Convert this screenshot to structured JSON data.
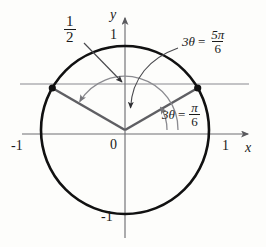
{
  "figure": {
    "type": "unit-circle-diagram",
    "axes": {
      "x_label": "x",
      "y_label": "y",
      "origin_label": "0",
      "x_ticks": [
        {
          "label": "-1",
          "value": -1
        },
        {
          "label": "1",
          "value": 1
        }
      ],
      "y_ticks": [
        {
          "label": "1",
          "value": 1
        },
        {
          "label": "-1",
          "value": -1
        }
      ]
    },
    "annotations": {
      "half_line": {
        "numerator": "1",
        "denominator": "2",
        "value": 0.5
      },
      "angle_small": {
        "lhs": "3θ",
        "eq": "=",
        "numerator": "π",
        "denominator": "6",
        "degrees": 30
      },
      "angle_large": {
        "lhs": "3θ",
        "eq": "=",
        "numerator": "5π",
        "denominator": "6",
        "degrees": 150
      }
    },
    "points": [
      {
        "name": "intersection-left",
        "x": -0.866,
        "y": 0.5
      },
      {
        "name": "intersection-right",
        "x": 0.866,
        "y": 0.5
      }
    ],
    "colors": {
      "circle": "#111111",
      "axis": "#6f6f73",
      "radius": "#5f5f63",
      "arc": "#8b8b90",
      "arrow": "#3a3a3e",
      "text": "#1a1a1a",
      "background": "#fdfdfb"
    }
  }
}
